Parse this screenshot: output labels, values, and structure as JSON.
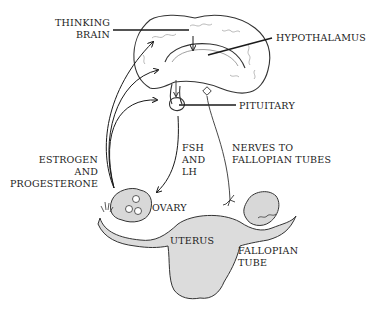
{
  "diagram": {
    "labels": {
      "thinking_brain_1": "THINKING",
      "thinking_brain_2": "BRAIN",
      "hypothalamus": "HYPOTHALAMUS",
      "pituitary": "PITUITARY",
      "fsh_1": "FSH",
      "fsh_2": "AND",
      "fsh_3": "LH",
      "nerves_1": "NERVES TO",
      "nerves_2": "FALLOPIAN TUBES",
      "estrogen_1": "ESTROGEN",
      "estrogen_2": "AND",
      "estrogen_3": "PROGESTERONE",
      "ovary": "OVARY",
      "uterus": "UTERUS",
      "fallopian_1": "FALLOPIAN",
      "fallopian_2": "TUBE"
    },
    "colors": {
      "ink": "#1a1a1a",
      "sketch": "#555555",
      "shade": "#d8d8d8"
    }
  }
}
